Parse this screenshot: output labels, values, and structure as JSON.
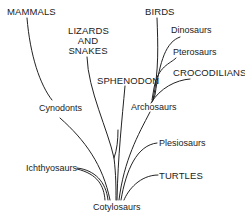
{
  "diagram": {
    "type": "phylogenetic-tree",
    "root": "Cotylosaurs",
    "labels": {
      "mammals": "MAMMALS",
      "cynodonts": "Cynodonts",
      "lizards_line1": "LIZARDS",
      "lizards_line2": "AND",
      "lizards_line3": "SNAKES",
      "sphenodon": "SPHENODON",
      "birds": "BIRDS",
      "dinosaurs": "Dinosaurs",
      "pterosaurs": "Pterosaurs",
      "crocodilians": "CROCODILIANS",
      "archosaurs": "Archosaurs",
      "plesiosaurs": "Plesiosaurs",
      "ichthyosaurs": "Ichthyosaurs",
      "turtles": "TURTLES",
      "cotylosaurs": "Cotylosaurs"
    },
    "tree": {
      "name": "Cotylosaurs",
      "children": [
        {
          "name": "Cynodonts",
          "children": [
            {
              "name": "MAMMALS"
            }
          ]
        },
        {
          "name": "Ichthyosaurs"
        },
        {
          "name": "LIZARDS AND SNAKES"
        },
        {
          "name": "SPHENODON"
        },
        {
          "name": "Archosaurs",
          "children": [
            {
              "name": "BIRDS"
            },
            {
              "name": "Dinosaurs"
            },
            {
              "name": "Pterosaurs"
            },
            {
              "name": "CROCODILIANS"
            }
          ]
        },
        {
          "name": "Plesiosaurs"
        },
        {
          "name": "TURTLES"
        }
      ]
    },
    "line_color": "#222222",
    "text_color": "#222222",
    "background": "#ffffff"
  }
}
